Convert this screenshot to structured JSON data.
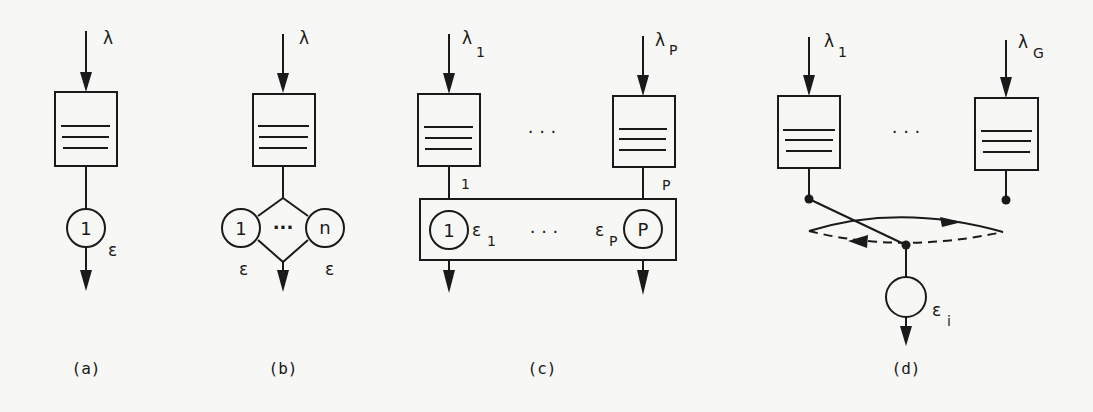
{
  "figure": {
    "panels": [
      {
        "id": "a",
        "caption": "(a)",
        "arrival_symbol": "λ",
        "server_label": "1",
        "service_symbol": "ε"
      },
      {
        "id": "b",
        "caption": "(b)",
        "arrival_symbol": "λ",
        "server_left_label": "1",
        "server_right_label": "n",
        "ellipsis": "···",
        "service_symbol_left": "ε",
        "service_symbol_right": "ε"
      },
      {
        "id": "c",
        "caption": "(c)",
        "arrival_left_symbol": "λ",
        "arrival_left_sub": "1",
        "arrival_right_symbol": "λ",
        "arrival_right_sub": "P",
        "queue_ellipsis": "· · ·",
        "queue_left_tag": "1",
        "queue_right_tag": "P",
        "server_left_label": "1",
        "server_right_label": "P",
        "service_left_symbol": "ε",
        "service_left_sub": "1",
        "service_right_symbol": "ε",
        "service_right_sub": "P",
        "server_ellipsis": "· · ·"
      },
      {
        "id": "d",
        "caption": "(d)",
        "arrival_left_symbol": "λ",
        "arrival_left_sub": "1",
        "arrival_right_symbol": "λ",
        "arrival_right_sub": "G",
        "queue_ellipsis": "· · ·",
        "service_symbol": "ε",
        "service_sub": "i"
      }
    ],
    "colors": {
      "ink": "#1a1a1a",
      "paper": "#f7f7f5"
    }
  }
}
